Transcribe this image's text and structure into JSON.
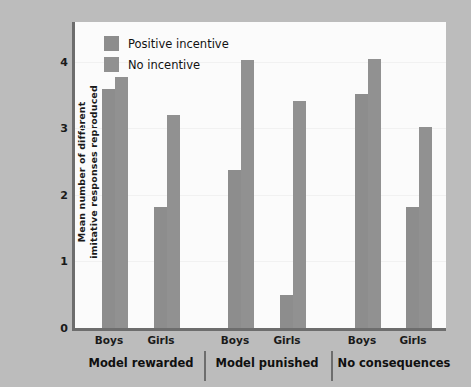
{
  "chart_data": {
    "type": "bar",
    "title": "",
    "xlabel": "",
    "ylabel": "Mean number of different imitative responses reproduced",
    "ylabel_line1": "Mean number of different",
    "ylabel_line2": "imitative responses reproduced",
    "ylim": [
      0,
      4.6
    ],
    "yticks": [
      0,
      1,
      2,
      3,
      4
    ],
    "ytick_labels": [
      "0",
      "1",
      "2",
      "3",
      "4"
    ],
    "grid": false,
    "legend_position": "top-left",
    "groups": [
      "Model rewarded",
      "Model punished",
      "No consequences"
    ],
    "categories": [
      "Boys",
      "Girls",
      "Boys",
      "Girls",
      "Boys",
      "Girls"
    ],
    "series": [
      {
        "name": "Positive incentive",
        "color": "#8d8d8d",
        "values": [
          3.6,
          1.82,
          2.38,
          0.5,
          3.52,
          1.82
        ]
      },
      {
        "name": "No incentive",
        "color": "#919191",
        "values": [
          3.78,
          3.2,
          4.03,
          3.42,
          4.05,
          3.02
        ]
      }
    ]
  },
  "legend": {
    "items": [
      {
        "label": "Positive incentive",
        "color": "#8d8d8d"
      },
      {
        "label": "No incentive",
        "color": "#919191"
      }
    ]
  },
  "axes": {
    "y_title_line1": "Mean number of different",
    "y_title_line2": "imitative responses reproduced",
    "y_ticks": [
      "4",
      "3",
      "2",
      "1",
      "0"
    ]
  },
  "x_axis": {
    "ticks": [
      "Boys",
      "Girls",
      "Boys",
      "Girls",
      "Boys",
      "Girls"
    ],
    "groups": [
      "Model rewarded",
      "Model punished",
      "No consequences"
    ]
  },
  "colors": {
    "figure_background": "#bcbcbc",
    "plot_background": "#fbfbfb",
    "axis": "#6d6d6d",
    "bar_positive": "#8d8d8d",
    "bar_none": "#919191",
    "text": "#1a1a1a"
  }
}
